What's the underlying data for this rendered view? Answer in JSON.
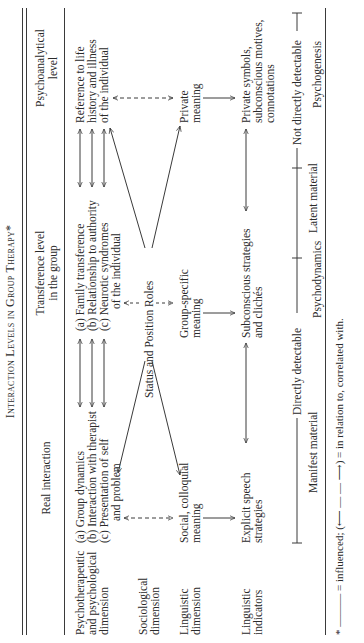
{
  "title": "Interaction Levels in Group Therapy*",
  "columns": {
    "real": "Real interaction",
    "transference_line1": "Transference level",
    "transference_line2": "in the group",
    "psycho_line1": "Psychoanalytical",
    "psycho_line2": "level"
  },
  "rows": {
    "psychotherapeutic": [
      "Psychotherapeutic",
      "and psychological",
      "dimension"
    ],
    "sociological": [
      "Sociological",
      "dimension"
    ],
    "linguistic_dimension": [
      "Linguistic",
      "dimension"
    ],
    "linguistic_indicators": [
      "Linguistic",
      "indicators"
    ]
  },
  "real_items": {
    "a": "(a)  Group dynamics",
    "b": "(b)  Interaction with therapist",
    "c": "(c)  Presentation of self",
    "c2": "and problem",
    "social1": "Social, colloquial",
    "social2": "meaning",
    "explicit1": "Explicit speech",
    "explicit2": "strategies"
  },
  "transference_items": {
    "a": "(a)  Family transference",
    "b": "(b)  Relationship to authority",
    "c": "(c)  Neurotic syndromes",
    "c2": "of the individual",
    "status": "Status and Position Roles",
    "group1": "Group-specific",
    "group2": "meaning",
    "sub1": "Subconscious strategies",
    "sub2": "and clichés"
  },
  "psycho_items": {
    "ref1": "Reference to life",
    "ref2": "history and illness",
    "ref3": "of the individual",
    "private1": "Private",
    "private2": "meaning",
    "symbols1": "Private symbols,",
    "symbols2": "subconscious motives,",
    "symbols3": "connotations"
  },
  "detectability": {
    "direct": "Directly detectable",
    "not_direct": "Not directly detectable"
  },
  "material": {
    "manifest": "Manifest material",
    "latent": "Latent material"
  },
  "bottom_labels": {
    "psychodynamics": "Psychodynamics",
    "psychogenesis": "Psychogenesis"
  },
  "footnote": "* ——— = influenced; (⟵ — — ⟶) = in relation to, correlated with."
}
